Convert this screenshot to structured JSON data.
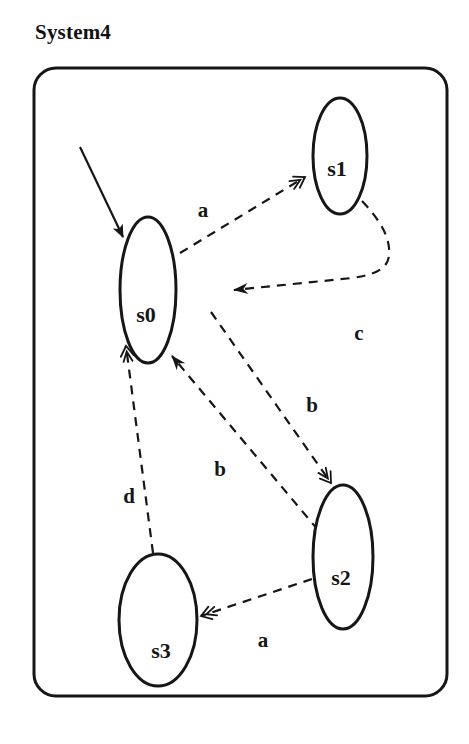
{
  "title": "System4",
  "colors": {
    "ink": "#161616",
    "background": "#ffffff"
  },
  "diagram": {
    "frame": {
      "x": 34,
      "y": 68,
      "width": 413,
      "height": 628,
      "corner_radius": 22
    },
    "states": [
      {
        "id": "s0",
        "label": "s0",
        "cx": 148,
        "cy": 290,
        "rx": 28,
        "ry": 73,
        "label_x": 146,
        "label_y": 322
      },
      {
        "id": "s1",
        "label": "s1",
        "cx": 340,
        "cy": 156,
        "rx": 27,
        "ry": 58,
        "label_x": 337,
        "label_y": 176
      },
      {
        "id": "s2",
        "label": "s2",
        "cx": 343,
        "cy": 557,
        "rx": 30,
        "ry": 72,
        "label_x": 341,
        "label_y": 585
      },
      {
        "id": "s3",
        "label": "s3",
        "cx": 158,
        "cy": 620,
        "rx": 39,
        "ry": 66,
        "label_x": 161,
        "label_y": 658
      }
    ],
    "initial_arrow": {
      "to": "s0",
      "path": "M 80 147 L 123 237",
      "head": "init",
      "style": "solid"
    },
    "transitions": [
      {
        "label": "a",
        "from": "s0",
        "to": "s1",
        "path": "M 180 253 L 305 177",
        "head": "open",
        "label_x": 203,
        "label_y": 217
      },
      {
        "label": "c",
        "from": "s1",
        "to": "s0",
        "path": "M 362 201 C 379 219 391 237 389 256 C 387 270 373 275 352 278 L 234 290",
        "head": "filled",
        "label_x": 359,
        "label_y": 340
      },
      {
        "label": "b",
        "from": "s0",
        "to": "s2",
        "path": "M 211 312 L 331 483",
        "head": "open",
        "label_x": 312,
        "label_y": 412
      },
      {
        "label": "b",
        "from": "s2",
        "to": "s0",
        "path": "M 318 530 L 172 356",
        "head": "filled",
        "label_x": 220,
        "label_y": 476
      },
      {
        "label": "d",
        "from": "s3",
        "to": "s0",
        "path": "M 153 553 L 126 346",
        "head": "open",
        "label_x": 129,
        "label_y": 503
      },
      {
        "label": "a",
        "from": "s2",
        "to": "s3",
        "path": "M 312 579 L 201 616",
        "head": "open",
        "label_x": 263,
        "label_y": 647
      }
    ]
  }
}
